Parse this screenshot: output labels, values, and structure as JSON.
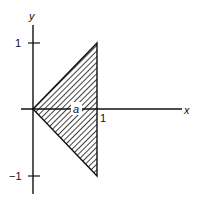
{
  "diagram": {
    "axes": {
      "x_label": "x",
      "y_label": "y"
    },
    "ticks": {
      "y_pos": "1",
      "y_neg": "−1",
      "x_one": "1"
    },
    "region": {
      "label": "a",
      "shape": "triangle",
      "vertices": [
        [
          0,
          0
        ],
        [
          1,
          1
        ],
        [
          1,
          -1
        ]
      ],
      "fill": "hatched"
    },
    "colors": {
      "ink": "#111111",
      "background": "#ffffff"
    }
  }
}
